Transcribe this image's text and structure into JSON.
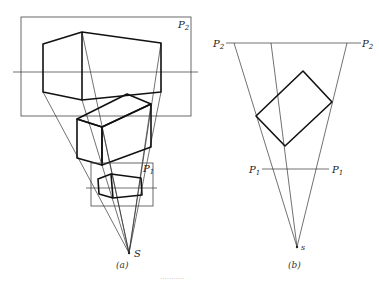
{
  "figure": {
    "panel_a": {
      "caption": "(a)",
      "picture_plane_large_label": "P",
      "picture_plane_large_sub": "2",
      "picture_plane_small_label": "P",
      "picture_plane_small_sub": "1",
      "station_point_label": "S"
    },
    "panel_b": {
      "caption": "(b)",
      "top_plane_left_label": "P",
      "top_plane_left_sub": "2",
      "top_plane_right_label": "P",
      "top_plane_right_sub": "2",
      "bottom_plane_left_label": "P",
      "bottom_plane_left_sub": "1",
      "bottom_plane_right_label": "P",
      "bottom_plane_right_sub": "1",
      "station_point_label": "s"
    },
    "footer_caption": "···········"
  }
}
